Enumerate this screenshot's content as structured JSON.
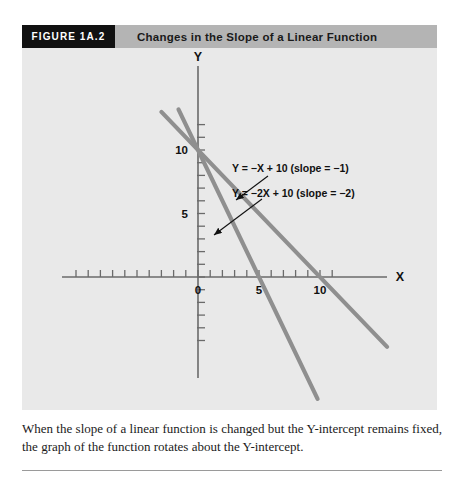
{
  "figure": {
    "number_label": "FIGURE 1A.2",
    "title": "Changes in the Slope of a Linear Function",
    "caption": "When the slope of a linear function is changed but the Y-intercept remains fixed, the graph of the function rotates about the Y-intercept."
  },
  "colors": {
    "header_bar": "#b4b4b4",
    "number_box": "#111111",
    "panel_background": "#e9e9e9",
    "line": "#8f8f8f",
    "axis": "#5a5a5a",
    "text": "#111111"
  },
  "chart_data": {
    "type": "line",
    "title": "Changes in the Slope of a Linear Function",
    "xlabel": "X",
    "ylabel": "Y",
    "xlim": [
      -11,
      19
    ],
    "ylim": [
      -8.5,
      17
    ],
    "grid": false,
    "legend": "none",
    "x_ticks": [
      -10,
      -9,
      -8,
      -7,
      -6,
      -5,
      -4,
      -3,
      -2,
      -1,
      0,
      1,
      2,
      3,
      4,
      5,
      6,
      7,
      8,
      9,
      10,
      11
    ],
    "x_tick_labels": [
      {
        "value": 0,
        "label": "0"
      },
      {
        "value": 5,
        "label": "5"
      },
      {
        "value": 10,
        "label": "10"
      }
    ],
    "y_ticks": [
      -5,
      -4,
      -3,
      -2,
      -1,
      0,
      1,
      2,
      3,
      4,
      5,
      6,
      7,
      8,
      9,
      10,
      11,
      12
    ],
    "y_tick_labels": [
      {
        "value": 5,
        "label": "5"
      },
      {
        "value": 10,
        "label": "10"
      }
    ],
    "series": [
      {
        "name": "Y = -X + 10",
        "label": "Y = −X + 10 (slope = −1)",
        "slope": -1,
        "intercept": 10,
        "x": [
          -3.0,
          15.5
        ],
        "y": [
          13.0,
          -5.5
        ]
      },
      {
        "name": "Y = -2X + 10",
        "label": "Y = −2X + 10 (slope = −2)",
        "slope": -2,
        "intercept": 10,
        "x": [
          -1.6,
          9.8
        ],
        "y": [
          13.2,
          -9.6
        ]
      }
    ],
    "annotations": [
      {
        "text": "Y = −X + 10 (slope = −1)",
        "text_x": 232,
        "text_y": 172,
        "arrow_from": [
          268,
          176
        ],
        "arrow_to": [
          236,
          200
        ]
      },
      {
        "text": "Y = −2X + 10 (slope = −2)",
        "text_x": 232,
        "text_y": 197,
        "arrow_from": [
          262,
          199
        ],
        "arrow_to": [
          214,
          235
        ]
      }
    ]
  }
}
